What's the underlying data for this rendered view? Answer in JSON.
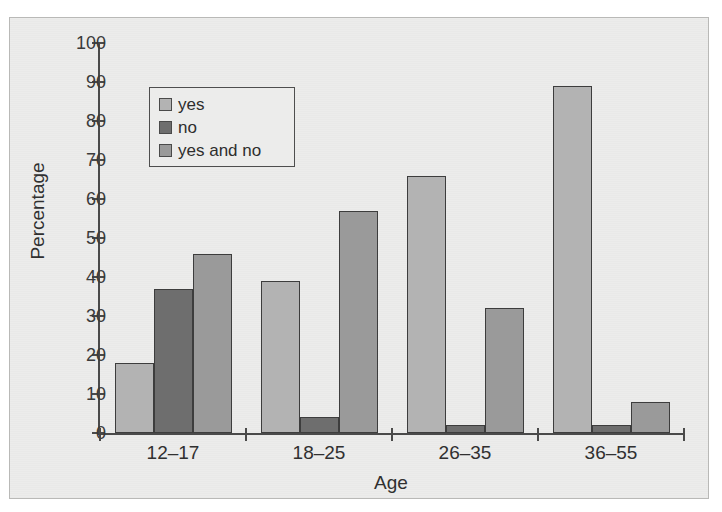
{
  "chart_data": {
    "type": "bar",
    "title": "",
    "subtitle": "",
    "xlabel": "Age",
    "ylabel": "Percentage",
    "categories": [
      "12–17",
      "18–25",
      "26–35",
      "36–55"
    ],
    "series": [
      {
        "name": "yes",
        "color": "#b3b3b3",
        "values": [
          18,
          39,
          66,
          89
        ]
      },
      {
        "name": "no",
        "color": "#6e6e6e",
        "values": [
          37,
          4,
          2,
          2
        ]
      },
      {
        "name": "yes and no",
        "color": "#9a9a9a",
        "values": [
          46,
          57,
          32,
          8
        ]
      }
    ],
    "ylim": [
      0,
      100
    ],
    "ytick_labels": [
      "0",
      "10",
      "20",
      "30",
      "40",
      "50",
      "60",
      "70",
      "80",
      "90",
      "100"
    ],
    "ytick_values": [
      0,
      10,
      20,
      30,
      40,
      50,
      60,
      70,
      80,
      90,
      100
    ],
    "grid": false,
    "legend_position": "upper-left-inset",
    "legend_entries": [
      "yes",
      "no",
      "yes and no"
    ]
  },
  "figure": {
    "background_color": "#ececeb",
    "axis_color": "#4a4a4a",
    "text_color": "#303030",
    "bar_edge_color": "#3d3d3d"
  }
}
